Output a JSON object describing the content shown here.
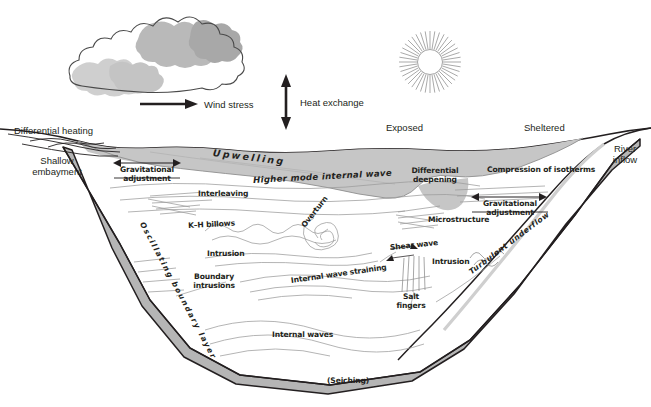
{
  "figure": {
    "kind": "lake-mixing-processes-schematic",
    "background": "#ffffff",
    "palette": {
      "water_fill": "#ffffff",
      "sediment_fill": "#c9c9c9",
      "cloud_shadow": "#c0c0c0",
      "cloud_shadow_light": "#d6d6d6",
      "outline": "#231f20",
      "thin_line": "#8a8a8a",
      "sun_ray": "#9a9a9a"
    }
  },
  "atmosphere": {
    "cloud": {
      "name": "cloud-shape"
    },
    "sun": {
      "name": "sun-shape",
      "rays": 40
    },
    "wind_stress": {
      "label": "Wind stress",
      "arrow": "right"
    },
    "heat_exchange": {
      "label": "Heat exchange",
      "arrow": "up-down"
    }
  },
  "surface_labels": {
    "differential_heating": "Differential heating",
    "shallow_embayment_line1": "Shallow",
    "shallow_embayment_line2": "embayment",
    "exposed": "Exposed",
    "sheltered": "Sheltered",
    "river_inflow_line1": "River",
    "river_inflow_line2": "inflow"
  },
  "process_labels": {
    "grav_adjust_left_line1": "Gravitational",
    "grav_adjust_left_line2": "adjustment",
    "grav_adjust_right_line1": "Gravitational",
    "grav_adjust_right_line2": "adjustment",
    "upwelling": "Upwelling",
    "higher_mode_internal_wave": "Higher mode internal wave",
    "interleaving": "Interleaving",
    "kh_billows": "K–H billows",
    "overturn": "Overturn",
    "microstructure": "Microstructure",
    "differential_deepening_line1": "Differential",
    "differential_deepening_line2": "deepening",
    "compression_of_isotherms": "Compression of isotherms",
    "intrusion_left": "Intrusion",
    "intrusion_right": "Intrusion",
    "boundary_intrusions_line1": "Boundary",
    "boundary_intrusions_line2": "intrusions",
    "internal_wave_straining": "Internal wave straining",
    "shear_wave": "Shear wave",
    "salt_fingers_line1": "Salt",
    "salt_fingers_line2": "fingers",
    "oscillating_boundary_layer": "Oscillating boundary layer",
    "turbulent_underflow": "Turbulent underflow",
    "internal_waves": "Internal waves",
    "seiching": "(Seiching)"
  }
}
